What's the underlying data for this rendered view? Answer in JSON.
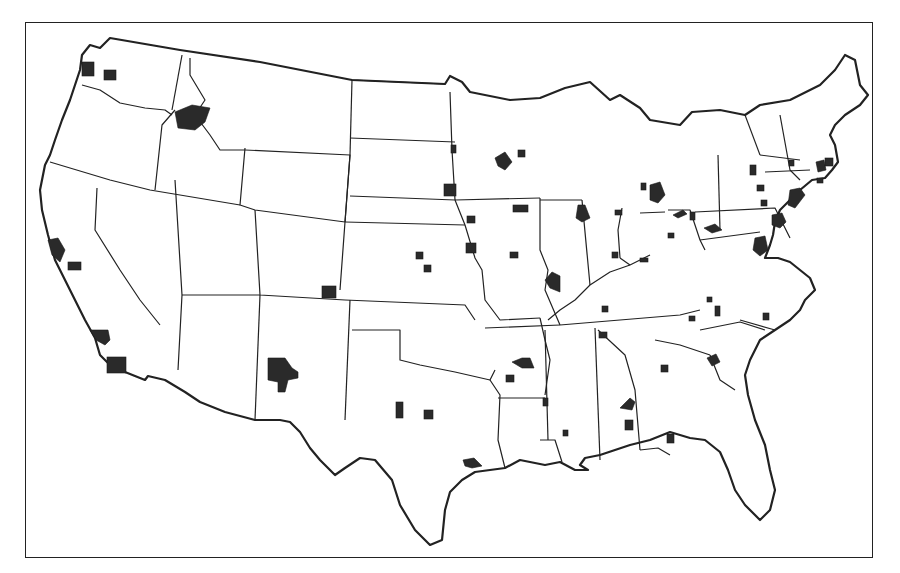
{
  "map": {
    "title": "",
    "subject": "United States metropolitan areas",
    "colors": {
      "background": "#ffffff",
      "lines": "#222222",
      "metro_fill": "#2a2a2a"
    },
    "frame": {
      "x": 25,
      "y": 22,
      "w": 848,
      "h": 536
    },
    "outline": "M110,38 L180,50 L260,62 L352,80 L445,84 L450,76 L462,82 L470,92 L510,100 L540,98 L565,88 L590,82 L610,100 L620,95 L640,108 L650,120 L680,125 L692,112 L720,110 L745,115 L760,105 L790,100 L800,95 L820,85 L835,70 L845,55 L855,60 L860,85 L868,95 L860,105 L845,115 L835,125 L830,135 L835,145 L838,162 L832,170 L825,178 L812,180 L800,190 L790,200 L780,210 L775,222 L773,235 L770,245 L765,258 L778,258 L790,262 L800,270 L810,278 L815,290 L805,300 L800,310 L790,320 L775,330 L760,340 L750,360 L745,375 L748,395 L755,420 L765,445 L770,470 L775,490 L770,510 L760,520 L745,505 L735,490 L728,470 L720,452 L705,440 L690,438 L670,432 L650,440 L630,445 L615,450 L600,455 L585,458 L580,465 L588,470 L575,470 L560,462 L545,465 L520,460 L505,468 L490,470 L475,472 L462,480 L450,492 L445,510 L442,540 L430,545 L415,530 L400,505 L392,480 L375,460 L360,458 L345,468 L335,475 L320,460 L310,448 L300,432 L290,422 L280,420 L255,420 L225,412 L200,402 L185,392 L165,380 L148,376 L145,380 L125,372 L110,365 L100,355 L95,338 L85,320 L75,300 L65,280 L55,260 L48,235 L42,210 L40,190 L45,165 L50,155 L55,140 L62,120 L70,100 L75,85 L80,70 L82,55 L90,45 L100,48 L110,38 Z",
    "state_lines": [
      "M82,85 L100,90 L120,103 L145,108 L165,110 L172,115",
      "M50,162 L110,180 L150,190 L240,205",
      "M97,188 L95,230 L120,270 L140,300 L160,325",
      "M175,110 L162,125 L155,190",
      "M182,55 L172,110",
      "M190,58 L190,75 L205,100 L195,115 L210,135 L220,150 L245,150",
      "M245,148 L240,205 L255,210 L345,222",
      "M245,150 L350,155 L345,222",
      "M352,80 L350,155",
      "M350,155 L345,222 L340,290",
      "M345,222 L465,225",
      "M352,80 L445,84",
      "M350,138 L455,142",
      "M350,196 L455,200 L465,225",
      "M255,210 L260,295 L345,300",
      "M182,295 L260,295",
      "M175,180 L182,295 L178,370",
      "M260,295 L255,420",
      "M350,300 L345,420",
      "M345,300 L465,305 L475,320",
      "M352,330 L400,330 L400,360 L420,365 L455,372 L490,380 L495,370",
      "M450,92 L452,150 L455,200",
      "M455,200 L540,198",
      "M465,225 L475,258 L482,270 L485,300 L500,320 L540,318",
      "M485,328 L560,325",
      "M540,318 L545,340 L550,360 L545,395",
      "M490,380 L500,395 L498,440 L505,468",
      "M498,398 L545,398",
      "M540,440 L555,440 L562,462",
      "M545,330 L548,440",
      "M595,328 L600,460",
      "M598,330 L625,355 L635,390 L640,450",
      "M540,198 L540,250 L548,270 L545,290 L560,325",
      "M540,200 L582,200",
      "M582,200 L590,285",
      "M548,320 L560,310 L575,300 L590,285 L610,272 L630,265 L650,255",
      "M560,325 L620,320 L680,315 L700,310",
      "M620,258 L630,265",
      "M640,213 L665,212",
      "M668,210 L690,210 L700,240 L705,250",
      "M622,208 L618,230 L620,258",
      "M695,212 L775,208 L790,238",
      "M700,240 L760,232",
      "M718,155 L720,230",
      "M745,115 L760,155",
      "M780,115 L790,170 L800,180",
      "M760,155 L800,160",
      "M765,172 L810,170",
      "M700,330 L740,322 L765,330",
      "M710,355 L720,380 L735,390",
      "M655,340 L680,345 L710,355",
      "M740,320 L775,330",
      "M640,450 L658,448 L670,455"
    ],
    "metros": [
      {
        "name": "Seattle",
        "shape": "rect",
        "x": 82,
        "y": 62,
        "w": 12,
        "h": 14
      },
      {
        "name": "Tacoma-area",
        "shape": "rect",
        "x": 104,
        "y": 70,
        "w": 12,
        "h": 10
      },
      {
        "name": "Spokane",
        "shape": "poly",
        "points": "175,112 192,105 210,108 205,122 195,130 178,128"
      },
      {
        "name": "San Francisco",
        "shape": "poly",
        "points": "48,240 58,238 65,250 60,262 52,255"
      },
      {
        "name": "Sacramento-area",
        "shape": "rect",
        "x": 68,
        "y": 262,
        "w": 13,
        "h": 8
      },
      {
        "name": "Los Angeles",
        "shape": "poly",
        "points": "90,330 108,330 110,340 105,345 96,340"
      },
      {
        "name": "San Diego-area",
        "shape": "rect",
        "x": 107,
        "y": 357,
        "w": 19,
        "h": 16
      },
      {
        "name": "Albuquerque",
        "shape": "poly",
        "points": "268,358 285,358 292,368 298,372 298,378 288,380 285,392 278,392 278,382 268,380"
      },
      {
        "name": "Denver",
        "shape": "rect",
        "x": 322,
        "y": 286,
        "w": 14,
        "h": 12
      },
      {
        "name": "Wichita-area-1",
        "shape": "rect",
        "x": 416,
        "y": 252,
        "w": 7,
        "h": 7
      },
      {
        "name": "Wichita-area-2",
        "shape": "rect",
        "x": 424,
        "y": 265,
        "w": 7,
        "h": 7
      },
      {
        "name": "Kansas City",
        "shape": "rect",
        "x": 466,
        "y": 243,
        "w": 10,
        "h": 10
      },
      {
        "name": "Omaha",
        "shape": "rect",
        "x": 444,
        "y": 184,
        "w": 12,
        "h": 12
      },
      {
        "name": "Des Moines",
        "shape": "rect",
        "x": 513,
        "y": 205,
        "w": 15,
        "h": 7
      },
      {
        "name": "Sioux City-area",
        "shape": "rect",
        "x": 467,
        "y": 216,
        "w": 8,
        "h": 7
      },
      {
        "name": "Columbia MO-area",
        "shape": "rect",
        "x": 510,
        "y": 252,
        "w": 8,
        "h": 6
      },
      {
        "name": "St. Louis",
        "shape": "poly",
        "points": "545,280 552,272 560,276 560,292 550,288"
      },
      {
        "name": "Minneapolis",
        "shape": "poly",
        "points": "495,158 505,152 512,162 505,170 498,166"
      },
      {
        "name": "Duluth-area",
        "shape": "rect",
        "x": 518,
        "y": 150,
        "w": 7,
        "h": 7
      },
      {
        "name": "Sioux Falls-area",
        "shape": "rect",
        "x": 451,
        "y": 145,
        "w": 5,
        "h": 8
      },
      {
        "name": "Chicago",
        "shape": "poly",
        "points": "578,205 585,205 590,218 582,222 576,218"
      },
      {
        "name": "Fort Wayne-area",
        "shape": "rect",
        "x": 615,
        "y": 210,
        "w": 7,
        "h": 5
      },
      {
        "name": "Indianapolis",
        "shape": "rect",
        "x": 612,
        "y": 252,
        "w": 6,
        "h": 6
      },
      {
        "name": "Columbus OH-area",
        "shape": "rect",
        "x": 668,
        "y": 233,
        "w": 6,
        "h": 5
      },
      {
        "name": "Cincinnati-area",
        "shape": "rect",
        "x": 640,
        "y": 258,
        "w": 8,
        "h": 4
      },
      {
        "name": "Detroit",
        "shape": "poly",
        "points": "650,185 660,182 665,195 658,203 650,200"
      },
      {
        "name": "Flint-area",
        "shape": "rect",
        "x": 641,
        "y": 183,
        "w": 5,
        "h": 7
      },
      {
        "name": "Cleveland",
        "shape": "poly",
        "points": "673,215 683,210 687,214 678,218"
      },
      {
        "name": "Pittsburgh-area",
        "shape": "rect",
        "x": 690,
        "y": 212,
        "w": 5,
        "h": 8
      },
      {
        "name": "Harrisburg-area",
        "shape": "poly",
        "points": "704,228 715,224 722,230 712,233"
      },
      {
        "name": "Rochester-area",
        "shape": "rect",
        "x": 750,
        "y": 165,
        "w": 6,
        "h": 10
      },
      {
        "name": "Albany-area",
        "shape": "rect",
        "x": 757,
        "y": 185,
        "w": 7,
        "h": 6
      },
      {
        "name": "Scranton-area",
        "shape": "rect",
        "x": 761,
        "y": 200,
        "w": 6,
        "h": 6
      },
      {
        "name": "New York",
        "shape": "poly",
        "points": "790,190 800,188 805,195 795,208 788,205"
      },
      {
        "name": "Philadelphia",
        "shape": "poly",
        "points": "772,215 782,213 786,222 780,228 772,225"
      },
      {
        "name": "Baltimore-Washington",
        "shape": "poly",
        "points": "755,238 765,236 768,250 760,256 753,250"
      },
      {
        "name": "Boston",
        "shape": "poly",
        "points": "816,162 824,160 826,170 818,172"
      },
      {
        "name": "Providence-area",
        "shape": "rect",
        "x": 825,
        "y": 158,
        "w": 8,
        "h": 8
      },
      {
        "name": "Hartford-area",
        "shape": "rect",
        "x": 817,
        "y": 178,
        "w": 6,
        "h": 5
      },
      {
        "name": "Springfield MA-area",
        "shape": "rect",
        "x": 789,
        "y": 160,
        "w": 5,
        "h": 6
      },
      {
        "name": "Louisville-area",
        "shape": "rect",
        "x": 602,
        "y": 306,
        "w": 6,
        "h": 6
      },
      {
        "name": "Nashville",
        "shape": "rect",
        "x": 599,
        "y": 332,
        "w": 8,
        "h": 6
      },
      {
        "name": "Knoxville-area",
        "shape": "rect",
        "x": 689,
        "y": 316,
        "w": 6,
        "h": 5
      },
      {
        "name": "Winston-Salem-area",
        "shape": "rect",
        "x": 715,
        "y": 306,
        "w": 5,
        "h": 10
      },
      {
        "name": "Raleigh-area",
        "shape": "rect",
        "x": 763,
        "y": 313,
        "w": 6,
        "h": 7
      },
      {
        "name": "Roanoke-area",
        "shape": "rect",
        "x": 707,
        "y": 297,
        "w": 5,
        "h": 5
      },
      {
        "name": "Little Rock",
        "shape": "poly",
        "points": "512,362 522,358 530,358 534,368 522,368"
      },
      {
        "name": "Hot Springs-area",
        "shape": "rect",
        "x": 506,
        "y": 375,
        "w": 8,
        "h": 7
      },
      {
        "name": "Birmingham",
        "shape": "poly",
        "points": "620,408 630,398 635,402 632,410"
      },
      {
        "name": "Montgomery-area",
        "shape": "rect",
        "x": 625,
        "y": 420,
        "w": 8,
        "h": 10
      },
      {
        "name": "Atlanta",
        "shape": "rect",
        "x": 661,
        "y": 365,
        "w": 7,
        "h": 7
      },
      {
        "name": "Columbia SC",
        "shape": "poly",
        "points": "707,358 716,354 720,362 712,366"
      },
      {
        "name": "Dallas",
        "shape": "rect",
        "x": 396,
        "y": 402,
        "w": 7,
        "h": 16
      },
      {
        "name": "Fort Worth-area",
        "shape": "rect",
        "x": 424,
        "y": 410,
        "w": 9,
        "h": 9
      },
      {
        "name": "Houston",
        "shape": "poly",
        "points": "463,460 474,458 482,466 472,468 465,466"
      },
      {
        "name": "Shreveport-area",
        "shape": "rect",
        "x": 543,
        "y": 398,
        "w": 5,
        "h": 8
      },
      {
        "name": "Jackson-area",
        "shape": "rect",
        "x": 563,
        "y": 430,
        "w": 5,
        "h": 6
      },
      {
        "name": "Tallahassee-area",
        "shape": "rect",
        "x": 667,
        "y": 434,
        "w": 7,
        "h": 9
      }
    ]
  }
}
